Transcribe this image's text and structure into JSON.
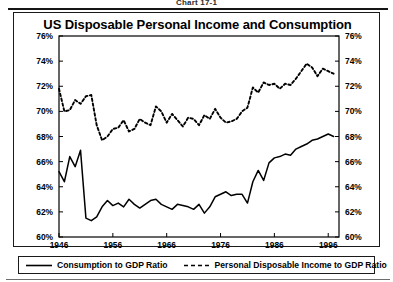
{
  "figure": {
    "caption": "Chart 17-1",
    "title": "US Disposable Personal Income and Consumption"
  },
  "legend": {
    "items": [
      {
        "label": "Consumption to GDP Ratio",
        "style": "solid",
        "color": "#000000",
        "icon": "solid-line-swatch"
      },
      {
        "label": "Personal Disposable Income to GDP Ratio",
        "style": "dashed",
        "color": "#000000",
        "icon": "dashed-line-swatch"
      }
    ]
  },
  "axes": {
    "y_left_ticks": [
      "60%",
      "62%",
      "64%",
      "66%",
      "68%",
      "70%",
      "72%",
      "74%",
      "76%"
    ],
    "y_right_ticks": [
      "60%",
      "62%",
      "64%",
      "66%",
      "68%",
      "70%",
      "72%",
      "74%",
      "76%"
    ],
    "x_ticks": [
      "1946",
      "1956",
      "1966",
      "1976",
      "1986",
      "1996"
    ]
  },
  "chart_data": {
    "type": "line",
    "title": "US Disposable Personal Income and Consumption",
    "subtitle": "Chart 17-1",
    "xlabel": "",
    "ylabel": "",
    "xlim": [
      1946,
      1998
    ],
    "ylim": [
      60,
      76
    ],
    "ytick_values": [
      60,
      62,
      64,
      66,
      68,
      70,
      72,
      74,
      76
    ],
    "ytick_labels": [
      "60%",
      "62%",
      "64%",
      "66%",
      "68%",
      "70%",
      "72%",
      "74%",
      "76%"
    ],
    "xtick_values": [
      1946,
      1956,
      1966,
      1976,
      1986,
      1996
    ],
    "xtick_labels": [
      "1946",
      "1956",
      "1966",
      "1976",
      "1986",
      "1996"
    ],
    "y_unit": "percent of GDP",
    "grid": false,
    "dual_axis": true,
    "legend_position": "below-plot",
    "x": [
      1946,
      1947,
      1948,
      1949,
      1950,
      1951,
      1952,
      1953,
      1954,
      1955,
      1956,
      1957,
      1958,
      1959,
      1960,
      1961,
      1962,
      1963,
      1964,
      1965,
      1966,
      1967,
      1968,
      1969,
      1970,
      1971,
      1972,
      1973,
      1974,
      1975,
      1976,
      1977,
      1978,
      1979,
      1980,
      1981,
      1982,
      1983,
      1984,
      1985,
      1986,
      1987,
      1988,
      1989,
      1990,
      1991,
      1992,
      1993,
      1994,
      1995,
      1996,
      1997
    ],
    "series": [
      {
        "name": "Consumption to GDP Ratio",
        "style": "solid",
        "color": "#000000",
        "values": [
          65.2,
          64.4,
          66.4,
          65.6,
          66.9,
          61.5,
          61.3,
          61.6,
          62.4,
          62.9,
          62.5,
          62.7,
          62.4,
          63.0,
          62.6,
          62.3,
          62.6,
          62.9,
          63.0,
          62.6,
          62.4,
          62.2,
          62.6,
          62.5,
          62.4,
          62.2,
          62.6,
          61.9,
          62.4,
          63.2,
          63.4,
          63.6,
          63.3,
          63.4,
          63.4,
          62.7,
          64.4,
          65.3,
          64.5,
          65.9,
          66.3,
          66.4,
          66.6,
          66.5,
          67.0,
          67.2,
          67.4,
          67.7,
          67.8,
          68.0,
          68.2,
          68.0
        ]
      },
      {
        "name": "Personal Disposable Income to GDP Ratio",
        "style": "dashed",
        "color": "#000000",
        "values": [
          71.8,
          70.0,
          70.1,
          70.9,
          70.6,
          71.2,
          71.3,
          68.9,
          67.7,
          68.0,
          68.6,
          68.7,
          69.3,
          68.4,
          68.6,
          69.4,
          69.1,
          68.9,
          70.4,
          70.0,
          69.1,
          69.8,
          69.3,
          68.8,
          69.5,
          69.4,
          68.9,
          69.7,
          69.4,
          70.2,
          69.5,
          69.1,
          69.2,
          69.4,
          70.0,
          70.3,
          71.9,
          71.5,
          72.3,
          72.1,
          72.2,
          71.8,
          72.2,
          72.1,
          72.6,
          73.2,
          73.8,
          73.5,
          72.8,
          73.4,
          73.2,
          73.0
        ]
      }
    ]
  }
}
